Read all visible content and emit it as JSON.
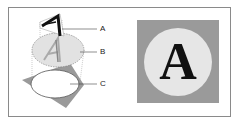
{
  "figure": {
    "left_panel": {
      "description": "Exploded view of layered artwork",
      "labels": [
        {
          "id": "A",
          "text": "A"
        },
        {
          "id": "B",
          "text": "B"
        },
        {
          "id": "C",
          "text": "C"
        }
      ],
      "glyph": "A"
    },
    "right_panel": {
      "description": "Composited result",
      "glyph": "A"
    },
    "colors": {
      "gray_fill": "#9a9a9a",
      "circle_fill": "#e6e6e6",
      "glyph": "#111111",
      "frame": "#8a8a8a"
    }
  }
}
